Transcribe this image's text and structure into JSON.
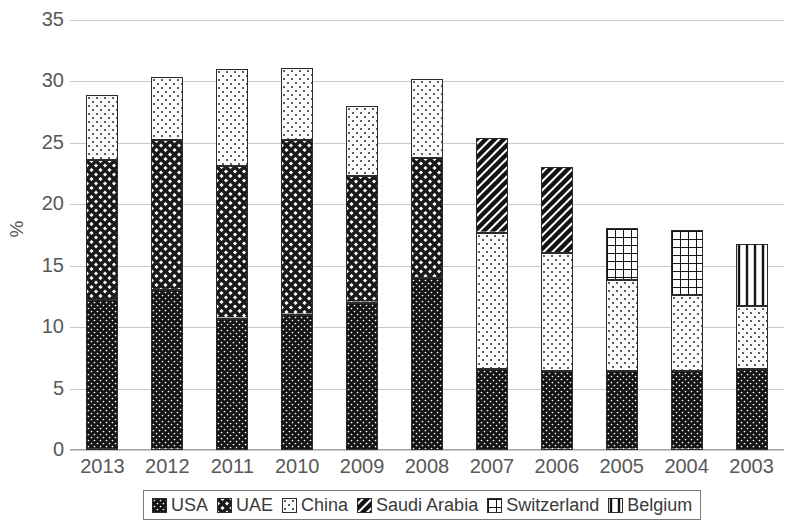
{
  "chart_data": {
    "type": "bar",
    "subtype": "stacked-bar-vertical",
    "title": "",
    "xlabel": "",
    "ylabel": "%",
    "ylim": [
      0,
      35
    ],
    "ytick_step": 5,
    "yticks": [
      35,
      30,
      25,
      20,
      15,
      10,
      5,
      0
    ],
    "grid": true,
    "legend_position": "bottom",
    "categories": [
      "2013",
      "2012",
      "2011",
      "2010",
      "2009",
      "2008",
      "2007",
      "2006",
      "2005",
      "2004",
      "2003"
    ],
    "series": [
      {
        "name": "USA",
        "pattern": "dense-dots-dark",
        "values": [
          12.2,
          13.0,
          10.7,
          11.0,
          12.0,
          14.0,
          6.6,
          6.4,
          6.4,
          6.4,
          6.6
        ]
      },
      {
        "name": "UAE",
        "pattern": "cross-hatch",
        "values": [
          11.4,
          12.2,
          12.4,
          14.2,
          10.3,
          9.8,
          0,
          0,
          0,
          0,
          0
        ]
      },
      {
        "name": "China",
        "pattern": "light-dots",
        "values": [
          5.3,
          5.2,
          7.9,
          5.9,
          5.7,
          6.4,
          11.1,
          9.6,
          7.4,
          6.2,
          5.1
        ]
      },
      {
        "name": "Saudi Arabia",
        "pattern": "diagonal-stripes",
        "values": [
          0,
          0,
          0,
          0,
          0,
          0,
          7.7,
          7.0,
          0,
          0,
          0
        ]
      },
      {
        "name": "Switzerland",
        "pattern": "grid-waffle",
        "values": [
          0,
          0,
          0,
          0,
          0,
          0,
          0,
          0,
          4.3,
          5.3,
          0
        ]
      },
      {
        "name": "Belgium",
        "pattern": "vertical-stripes",
        "values": [
          0,
          0,
          0,
          0,
          0,
          0,
          0,
          0,
          0,
          0,
          5.1
        ]
      }
    ],
    "totals": [
      28.9,
      30.4,
      31.0,
      31.1,
      28.0,
      30.2,
      25.4,
      23.0,
      18.1,
      17.9,
      16.8
    ]
  },
  "axis": {
    "y_title": "%",
    "y_tick_labels": [
      "35",
      "30",
      "25",
      "20",
      "15",
      "10",
      "5",
      "0"
    ],
    "x_tick_labels": [
      "2013",
      "2012",
      "2011",
      "2010",
      "2009",
      "2008",
      "2007",
      "2006",
      "2005",
      "2004",
      "2003"
    ]
  },
  "legend": {
    "items": [
      {
        "label": "USA",
        "pattern": "dense-dots-dark"
      },
      {
        "label": "UAE",
        "pattern": "cross-hatch"
      },
      {
        "label": "China",
        "pattern": "light-dots"
      },
      {
        "label": "Saudi Arabia",
        "pattern": "diagonal-stripes"
      },
      {
        "label": "Switzerland",
        "pattern": "grid-waffle"
      },
      {
        "label": "Belgium",
        "pattern": "vertical-stripes"
      }
    ]
  },
  "colors": {
    "series_outline": "#2b2b2b",
    "usa_fill": "#1a1a1a",
    "gridline": "#c8c8c8",
    "text": "#585858",
    "background": "#ffffff"
  }
}
